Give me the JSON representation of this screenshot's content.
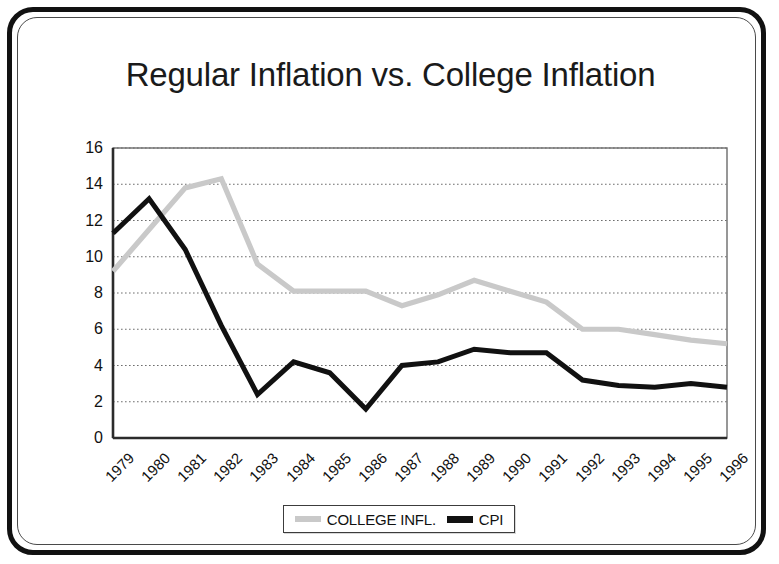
{
  "frame": {
    "border_color": "#111111",
    "inner_border_color": "#4a4a4a"
  },
  "chart_data": {
    "type": "line",
    "title": "Regular Inflation vs. College Inflation",
    "xlabel": "",
    "ylabel": "",
    "ylim": [
      0,
      16
    ],
    "ytick_step": 2,
    "yticks": [
      0,
      2,
      4,
      6,
      8,
      10,
      12,
      14,
      16
    ],
    "grid": true,
    "grid_style": "dotted-horizontal",
    "legend_position": "bottom-center",
    "categories": [
      "1979",
      "1980",
      "1981",
      "1982",
      "1983",
      "1984",
      "1985",
      "1986",
      "1987",
      "1988",
      "1989",
      "1990",
      "1991",
      "1992",
      "1993",
      "1994",
      "1995",
      "1996"
    ],
    "series": [
      {
        "name": "COLLEGE INFL.",
        "color": "#c9c9c9",
        "values": [
          9.2,
          11.5,
          13.8,
          14.3,
          9.6,
          8.1,
          8.1,
          8.1,
          7.3,
          7.9,
          8.7,
          8.1,
          7.5,
          6.0,
          6.0,
          5.7,
          5.4,
          5.2
        ]
      },
      {
        "name": "CPI",
        "color": "#111111",
        "values": [
          11.3,
          13.2,
          10.4,
          6.2,
          2.4,
          4.2,
          3.6,
          1.6,
          4.0,
          4.2,
          4.9,
          4.7,
          4.7,
          3.2,
          2.9,
          2.8,
          3.0,
          2.8
        ]
      }
    ]
  },
  "legend": {
    "entries": [
      {
        "label": "COLLEGE INFL.",
        "swatch_color": "#c9c9c9"
      },
      {
        "label": "CPI",
        "swatch_color": "#111111"
      }
    ]
  }
}
